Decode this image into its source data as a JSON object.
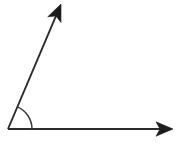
{
  "figure": {
    "kind": "geometry-angle-diagram",
    "title": "Angle formed by two rays",
    "background_color": "#ffffff",
    "stroke_color": "#2b2b2b",
    "arrow_fill_color": "#1c1c1c",
    "arc_color": "#3a3a3a",
    "canvas": {
      "width": 181,
      "height": 154
    }
  },
  "chart_data": {
    "type": "scatter",
    "title": "Angle formed by two rays",
    "xlabel": "",
    "ylabel": "",
    "xlim": [
      0,
      181
    ],
    "ylim": [
      0,
      154
    ],
    "grid": false,
    "legend": "none",
    "vertex": {
      "name": "vertex",
      "x": 8,
      "y": 129
    },
    "rays": [
      {
        "name": "horizontal-ray",
        "from": [
          8,
          129
        ],
        "to": [
          173,
          129
        ],
        "direction_degrees": 0,
        "arrowhead": "filled-triangle",
        "arrow_tip": [
          173,
          129
        ]
      },
      {
        "name": "diagonal-ray",
        "from": [
          8,
          129
        ],
        "to": [
          61,
          4
        ],
        "direction_degrees": 67,
        "arrowhead": "filled-triangle",
        "arrow_tip": [
          61,
          4
        ]
      }
    ],
    "arc": {
      "name": "angle-arc",
      "center": [
        8,
        129
      ],
      "radius": 24,
      "start_degrees": 0,
      "end_degrees": 67,
      "start_point": [
        32,
        129
      ],
      "end_point": [
        17,
        107
      ]
    },
    "measured_angle_degrees": 67
  }
}
